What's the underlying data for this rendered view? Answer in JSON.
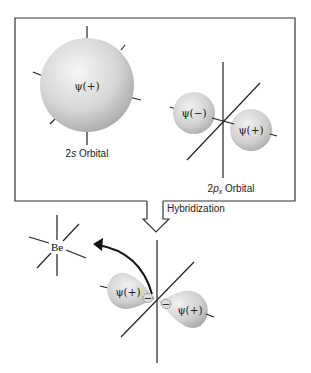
{
  "figure": {
    "panel": {
      "s_orbital": {
        "label_prefix": "2",
        "label_italic": "s",
        "label_suffix": " Orbital",
        "sign": "ψ(+)"
      },
      "p_orbital": {
        "label_prefix": "2",
        "label_italic": "p",
        "label_sub": "x",
        "label_suffix": " Orbital",
        "lobes": [
          "ψ(−)",
          "ψ(+)"
        ]
      }
    },
    "arrow_label": "Hybridization",
    "result": {
      "atom_label": "Be",
      "hybrid_lobes": [
        "ψ(+)",
        "ψ(+)"
      ],
      "minor_lobes": [
        "−",
        "−"
      ]
    },
    "colors": {
      "line": "#222222",
      "orbital_light": "#f4f4f4",
      "orbital_dark": "#a9a9a9",
      "background": "#ffffff"
    }
  }
}
